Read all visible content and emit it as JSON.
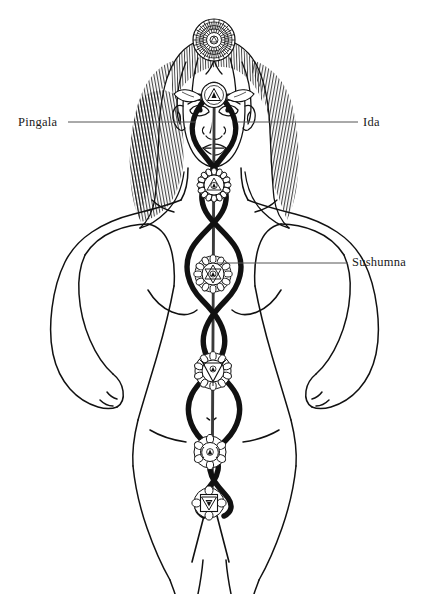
{
  "diagram": {
    "type": "anatomical-line-art",
    "background_color": "#ffffff",
    "ink_color": "#111111",
    "leader_line_color": "#555555",
    "width": 433,
    "height": 594
  },
  "labels": {
    "pingala": "Pingala",
    "ida": "Ida",
    "sushumna": "Sushumna"
  },
  "leader_lines": [
    {
      "name": "pingala-leader",
      "x1": 68,
      "y1": 122,
      "x2": 196,
      "y2": 122
    },
    {
      "name": "ida-leader",
      "x1": 238,
      "y1": 122,
      "x2": 358,
      "y2": 122
    },
    {
      "name": "sushumna-leader",
      "x1": 218,
      "y1": 263,
      "x2": 348,
      "y2": 263
    }
  ],
  "nadis": [
    {
      "name": "sushumna",
      "label": "Sushumna",
      "description": "straight central channel along the spine",
      "stroke_width": 2.2,
      "color": "#333333"
    },
    {
      "name": "ida",
      "label": "Ida",
      "description": "serpentine channel crossing left-to-right",
      "stroke_width": 5.5,
      "color": "#111111"
    },
    {
      "name": "pingala",
      "label": "Pingala",
      "description": "serpentine channel crossing right-to-left",
      "stroke_width": 5.5,
      "color": "#111111"
    }
  ],
  "chakras": [
    {
      "name": "sahasrara",
      "position": "crown",
      "cx": 214,
      "cy": 40,
      "radius": 21,
      "petals": 48,
      "symbol": "thousand-petal-lotus"
    },
    {
      "name": "ajna",
      "position": "third-eye",
      "cx": 214,
      "cy": 96,
      "radius": 13,
      "petals": 2,
      "symbol": "downward-triangle"
    },
    {
      "name": "vishuddha",
      "position": "throat",
      "cx": 214,
      "cy": 185,
      "radius": 16,
      "petals": 16,
      "symbol": "downward-triangle-circle"
    },
    {
      "name": "anahata",
      "position": "heart",
      "cx": 213,
      "cy": 274,
      "radius": 18,
      "petals": 12,
      "symbol": "hexagram"
    },
    {
      "name": "manipura",
      "position": "solar-plexus",
      "cx": 213,
      "cy": 371,
      "radius": 18,
      "petals": 10,
      "symbol": "downward-triangle"
    },
    {
      "name": "svadhisthana",
      "position": "sacral",
      "cx": 210,
      "cy": 452,
      "radius": 16,
      "petals": 6,
      "symbol": "crescent-circle"
    },
    {
      "name": "muladhara",
      "position": "root",
      "cx": 209,
      "cy": 503,
      "radius": 15,
      "petals": 4,
      "symbol": "square-downward-triangle"
    }
  ]
}
